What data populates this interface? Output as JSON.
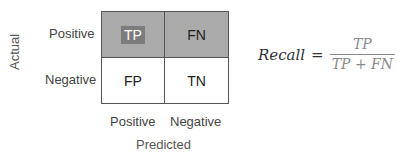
{
  "colors": {
    "positive_row_bg": "#aaaaaa",
    "tp_highlight_bg": "#7c7c7c"
  },
  "axes": {
    "y_label": "Actual",
    "x_label": "Predicted"
  },
  "rows": [
    {
      "label": "Positive"
    },
    {
      "label": "Negative"
    }
  ],
  "columns": [
    {
      "label": "Positive"
    },
    {
      "label": "Negative"
    }
  ],
  "cells": {
    "tp": "TP",
    "fn": "FN",
    "fp": "FP",
    "tn": "TN"
  },
  "formula": {
    "name": "Recall",
    "equals": "=",
    "numerator": "TP",
    "denominator": "TP + FN"
  }
}
